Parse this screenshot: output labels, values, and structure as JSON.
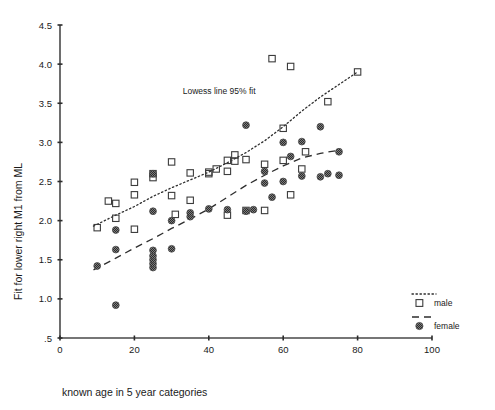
{
  "chart_data": {
    "type": "scatter",
    "title": "",
    "xlabel": "known age in 5 year categories",
    "ylabel": "Fit for lower right M1 from ML",
    "xlim": [
      0,
      100
    ],
    "ylim": [
      0.5,
      4.5
    ],
    "xticks": [
      "0",
      "20",
      "40",
      "60",
      "80",
      "100"
    ],
    "xtick_values": [
      0,
      20,
      40,
      60,
      80,
      100
    ],
    "yticks": [
      ".5",
      "1.0",
      "1.5",
      "2.0",
      "2.5",
      "3.0",
      "3.5",
      "4.0",
      "4.5"
    ],
    "ytick_values": [
      0.5,
      1.0,
      1.5,
      2.0,
      2.5,
      3.0,
      3.5,
      4.0,
      4.5
    ],
    "grid": false,
    "legend_position": "right",
    "annotations": [
      {
        "text": "Lowess line 95% fit",
        "x": 33,
        "y": 3.62
      }
    ],
    "series": [
      {
        "name": "male",
        "marker": "open-square",
        "line_style": "dotted",
        "points": [
          [
            10,
            1.91
          ],
          [
            15,
            2.22
          ],
          [
            15,
            2.03
          ],
          [
            13,
            2.25
          ],
          [
            20,
            2.49
          ],
          [
            20,
            2.33
          ],
          [
            20,
            1.89
          ],
          [
            25,
            2.6
          ],
          [
            25,
            2.55
          ],
          [
            30,
            2.75
          ],
          [
            30,
            2.32
          ],
          [
            35,
            2.26
          ],
          [
            31,
            2.08
          ],
          [
            35,
            2.61
          ],
          [
            40,
            2.62
          ],
          [
            40,
            2.6
          ],
          [
            42,
            2.66
          ],
          [
            45,
            2.77
          ],
          [
            45,
            2.63
          ],
          [
            47,
            2.84
          ],
          [
            47,
            2.76
          ],
          [
            50,
            2.78
          ],
          [
            50,
            2.13
          ],
          [
            55,
            2.13
          ],
          [
            55,
            2.72
          ],
          [
            57,
            4.07
          ],
          [
            62,
            3.97
          ],
          [
            60,
            3.18
          ],
          [
            60,
            2.77
          ],
          [
            62,
            2.33
          ],
          [
            65,
            2.66
          ],
          [
            66,
            2.88
          ],
          [
            72,
            3.52
          ],
          [
            80,
            3.9
          ],
          [
            45,
            2.07
          ]
        ]
      },
      {
        "name": "female",
        "marker": "filled-hatched-circle",
        "line_style": "dashed",
        "points": [
          [
            10,
            1.42
          ],
          [
            15,
            0.92
          ],
          [
            15,
            1.63
          ],
          [
            15,
            1.88
          ],
          [
            25,
            1.4
          ],
          [
            25,
            1.45
          ],
          [
            25,
            1.5
          ],
          [
            25,
            1.55
          ],
          [
            25,
            1.62
          ],
          [
            25,
            2.12
          ],
          [
            25,
            2.6
          ],
          [
            30,
            1.64
          ],
          [
            30,
            2.0
          ],
          [
            35,
            2.05
          ],
          [
            35,
            2.1
          ],
          [
            40,
            2.15
          ],
          [
            45,
            2.14
          ],
          [
            50,
            3.22
          ],
          [
            50,
            2.12
          ],
          [
            52,
            2.14
          ],
          [
            55,
            2.48
          ],
          [
            55,
            2.63
          ],
          [
            57,
            2.3
          ],
          [
            60,
            3.0
          ],
          [
            60,
            2.5
          ],
          [
            62,
            2.82
          ],
          [
            65,
            3.01
          ],
          [
            65,
            2.57
          ],
          [
            70,
            3.2
          ],
          [
            70,
            2.56
          ],
          [
            72,
            2.6
          ],
          [
            75,
            2.88
          ],
          [
            75,
            2.58
          ]
        ]
      }
    ],
    "fit_lines": [
      {
        "name": "male-lowess",
        "style": "dotted",
        "points": [
          [
            9,
            1.93
          ],
          [
            15,
            2.07
          ],
          [
            20,
            2.18
          ],
          [
            25,
            2.31
          ],
          [
            30,
            2.42
          ],
          [
            35,
            2.52
          ],
          [
            40,
            2.62
          ],
          [
            45,
            2.74
          ],
          [
            50,
            2.87
          ],
          [
            55,
            3.02
          ],
          [
            60,
            3.2
          ],
          [
            65,
            3.4
          ],
          [
            70,
            3.58
          ],
          [
            75,
            3.74
          ],
          [
            80,
            3.9
          ]
        ]
      },
      {
        "name": "female-lowess",
        "style": "dashed",
        "points": [
          [
            9,
            1.37
          ],
          [
            15,
            1.52
          ],
          [
            20,
            1.65
          ],
          [
            25,
            1.77
          ],
          [
            30,
            1.9
          ],
          [
            35,
            2.02
          ],
          [
            40,
            2.15
          ],
          [
            45,
            2.3
          ],
          [
            50,
            2.45
          ],
          [
            55,
            2.58
          ],
          [
            60,
            2.7
          ],
          [
            65,
            2.8
          ],
          [
            70,
            2.86
          ],
          [
            75,
            2.9
          ]
        ]
      }
    ]
  },
  "legend": {
    "items": [
      {
        "label": "male",
        "marker": "open-square",
        "line": "dotted"
      },
      {
        "label": "female",
        "marker": "filled-hatched-circle",
        "line": "dashed"
      }
    ]
  }
}
